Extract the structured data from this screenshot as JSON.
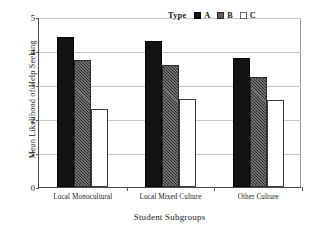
{
  "chart_data": {
    "type": "bar",
    "title": "",
    "xlabel": "Student Subgroups",
    "ylabel": "Mean Likelihood of Help Seeking",
    "categories": [
      "Local Monocultural",
      "Local Mixed Culture",
      "Other Culture"
    ],
    "series": [
      {
        "name": "A",
        "values": [
          4.4,
          4.3,
          3.8
        ],
        "color": "#131313",
        "fill": "solid-black"
      },
      {
        "name": "B",
        "values": [
          3.75,
          3.6,
          3.25
        ],
        "color": "#5d5d5d",
        "fill": "gray-diagonal-hatch"
      },
      {
        "name": "C",
        "values": [
          2.3,
          2.6,
          2.57
        ],
        "color": "#ffffff",
        "fill": "white-outline"
      }
    ],
    "ylim": [
      0,
      5
    ],
    "yticks": [
      0,
      1,
      2,
      3,
      4,
      5
    ],
    "ytick_labels": [
      "0",
      "1",
      "2",
      "3",
      "4",
      "5"
    ],
    "grid": "horizontal",
    "legend": {
      "title": "Type",
      "position": "top-right",
      "entries": [
        "A",
        "B",
        "C"
      ]
    }
  }
}
